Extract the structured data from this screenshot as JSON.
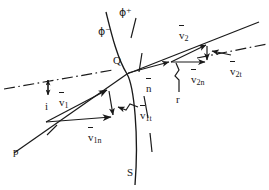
{
  "figure": {
    "background_color": "#ffffff",
    "ink_color": "#1a1a1a",
    "width": 269,
    "height": 190
  },
  "labels": {
    "phi_plus": {
      "symbol": "ϕ",
      "sign": "+",
      "x": 122,
      "y": 8
    },
    "phi_minus": {
      "symbol": "ϕ",
      "sign": "−",
      "x": 101,
      "y": 28
    },
    "point_q": {
      "text": "Q",
      "x": 116,
      "y": 62
    },
    "v1": {
      "base": "v",
      "sub": "1",
      "overline": true,
      "x": 62,
      "y": 92
    },
    "v1n": {
      "base": "v",
      "sub": "1n",
      "overline": true,
      "x": 92,
      "y": 128
    },
    "v1t": {
      "base": "v",
      "sub": "1t",
      "overline": true,
      "x": 142,
      "y": 105
    },
    "v2": {
      "base": "v",
      "sub": "2",
      "overline": true,
      "x": 181,
      "y": 25
    },
    "v2n": {
      "base": "v",
      "sub": "2n",
      "overline": true,
      "x": 193,
      "y": 71
    },
    "v2t": {
      "base": "v",
      "sub": "2t",
      "overline": true,
      "x": 231,
      "y": 61
    },
    "n_hat": {
      "base": "n",
      "sub": "",
      "overline": true,
      "x": 148,
      "y": 72
    },
    "angle_i": {
      "text": "i",
      "x": 43,
      "y": 104
    },
    "angle_r": {
      "text": "r",
      "x": 177,
      "y": 98
    },
    "ray_p": {
      "text": "p",
      "x": 15,
      "y": 148
    },
    "surface_s": {
      "text": "S",
      "x": 128,
      "y": 172
    }
  },
  "geometry": {
    "point_q": {
      "x": 127,
      "y": 74
    },
    "incident_ray": {
      "x1": 15,
      "y1": 152,
      "x2": 127,
      "y2": 74
    },
    "refracted_ray": {
      "x1": 127,
      "y1": 74,
      "x2": 258,
      "y2": 23
    },
    "normal_line": {
      "x1": 127,
      "y1": 74,
      "x2": 170,
      "y2": 62
    },
    "surface_curve": "M 107 10 C 112 40, 120 70, 127 74 C 135 80, 140 130, 136 186",
    "dashdot_left": {
      "x1": 4,
      "y1": 88,
      "x2": 112,
      "y2": 70
    },
    "dashdot_right": {
      "x1": 196,
      "y1": 57,
      "x2": 266,
      "y2": 45
    },
    "v1_vector": {
      "x1": 46,
      "y1": 122,
      "x2": 108,
      "y2": 90
    },
    "v1n_vector": {
      "x1": 46,
      "y1": 122,
      "x2": 112,
      "y2": 117
    },
    "v1t_vector": {
      "x1": 108,
      "y1": 90,
      "x2": 112,
      "y2": 117
    },
    "v2_vector": {
      "x1": 171,
      "y1": 62,
      "x2": 207,
      "y2": 46
    },
    "v2n_vector": {
      "x1": 171,
      "y1": 62,
      "x2": 207,
      "y2": 62
    },
    "v2t_vector": {
      "x1": 207,
      "y1": 46,
      "x2": 207,
      "y2": 62
    }
  },
  "line_styles": {
    "solid": "solid",
    "dash_dot": "dash-dot",
    "curve": "solid-curve"
  }
}
